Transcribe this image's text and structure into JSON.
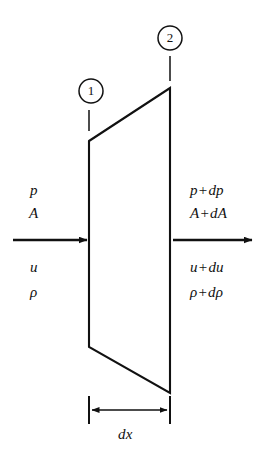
{
  "figure": {
    "kind": "quasi-one-dimensional-flow-control-volume",
    "background_color": "#ffffff",
    "line_color": "#111111",
    "width": 265,
    "height": 454
  },
  "stations": [
    {
      "id": "station-1",
      "label": "1",
      "circle": {
        "cx": 91,
        "cy": 91,
        "r": 12
      },
      "leader": {
        "x": 89,
        "y1": 110,
        "y2": 131
      }
    },
    {
      "id": "station-2",
      "label": "2",
      "circle": {
        "cx": 170,
        "cy": 38,
        "r": 12
      },
      "leader": {
        "x": 170,
        "y1": 56,
        "y2": 81
      }
    }
  ],
  "control_volume": {
    "name": "control-volume-trapezoid",
    "points": "89,141 170,88 170,393 89,347",
    "left_face": {
      "x": 89,
      "y_top": 141,
      "y_bottom": 347
    },
    "right_face": {
      "x": 170,
      "y_top": 88,
      "y_bottom": 393
    }
  },
  "inlet": {
    "arrow": {
      "x1": 13,
      "y": 240,
      "x2": 88
    },
    "labels_above": [
      {
        "text": "p",
        "x": 30,
        "y": 183
      },
      {
        "text": "A",
        "x": 29,
        "y": 206
      }
    ],
    "labels_below": [
      {
        "text": "u",
        "x": 30,
        "y": 260
      },
      {
        "text": "ρ",
        "x": 30,
        "y": 285
      }
    ]
  },
  "outlet": {
    "arrow": {
      "x1": 173,
      "y": 240,
      "x2": 253
    },
    "labels_above": [
      {
        "lhs": "p",
        "op": "+",
        "rhs": "dp",
        "x": 190,
        "y": 183
      },
      {
        "lhs": "A",
        "op": "+",
        "rhs": "dA",
        "x": 190,
        "y": 206
      }
    ],
    "labels_below": [
      {
        "lhs": "u",
        "op": "+",
        "rhs": "du",
        "x": 190,
        "y": 260
      },
      {
        "lhs": "ρ",
        "op": "+",
        "rhs": "dρ",
        "x": 190,
        "y": 285
      }
    ]
  },
  "dimension": {
    "name": "dx-dimension",
    "label": "dx",
    "label_x": 118,
    "label_y": 427,
    "line": {
      "y": 410,
      "x1": 89,
      "x2": 170
    },
    "ticks": [
      {
        "x": 89,
        "y1": 396,
        "y2": 424
      },
      {
        "x": 170,
        "y1": 396,
        "y2": 424
      }
    ]
  }
}
